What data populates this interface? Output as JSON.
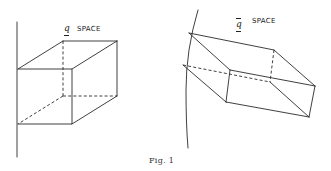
{
  "figure": {
    "caption": "Fig. 1",
    "left_panel": {
      "label_symbol": "q",
      "label_text": "SPACE",
      "shape": "cube (oblique projection) against vertical axis",
      "axis": {
        "x": 17,
        "y1": 22,
        "y2": 157
      },
      "front_face": [
        [
          18,
          69
        ],
        [
          72,
          69
        ],
        [
          72,
          124
        ],
        [
          18,
          124
        ]
      ],
      "back_face": [
        [
          63,
          41
        ],
        [
          117,
          41
        ],
        [
          117,
          96
        ],
        [
          63,
          96
        ]
      ],
      "hidden_edges": [
        "back-left vertical",
        "back bottom",
        "back-bottom-left to front-bottom-left"
      ]
    },
    "right_panel": {
      "label_symbol": "q̄",
      "label_text": "SPACE",
      "shape": "distorted parallelepiped against curved boundary",
      "boundary_arc": [
        [
          198,
          10
        ],
        [
          187,
          55
        ],
        [
          186,
          148
        ]
      ],
      "vertices": {
        "p1": [
          189,
          33
        ],
        "p2": [
          230,
          70
        ],
        "p3": [
          226,
          102
        ],
        "p4": [
          183,
          65
        ],
        "p5": [
          274,
          50
        ],
        "p6": [
          315,
          86
        ],
        "p7": [
          309,
          117
        ],
        "p8": [
          270,
          82
        ]
      }
    }
  }
}
